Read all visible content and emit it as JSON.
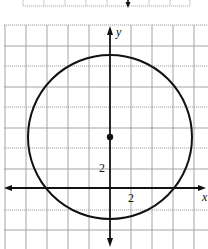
{
  "figure": {
    "type": "circle-on-coordinate-grid",
    "axes": {
      "x_label": "x",
      "y_label": "y",
      "x_tick_label": "2",
      "y_tick_label": "2"
    },
    "circle": {
      "center_marked": true,
      "stroke_color": "#111111"
    },
    "colors": {
      "grid": "#9a9a9a",
      "axis": "#111111",
      "background": "#ffffff"
    },
    "top_fragment": {
      "description": "bottom edge of a previous grid with downward axis arrow"
    }
  }
}
